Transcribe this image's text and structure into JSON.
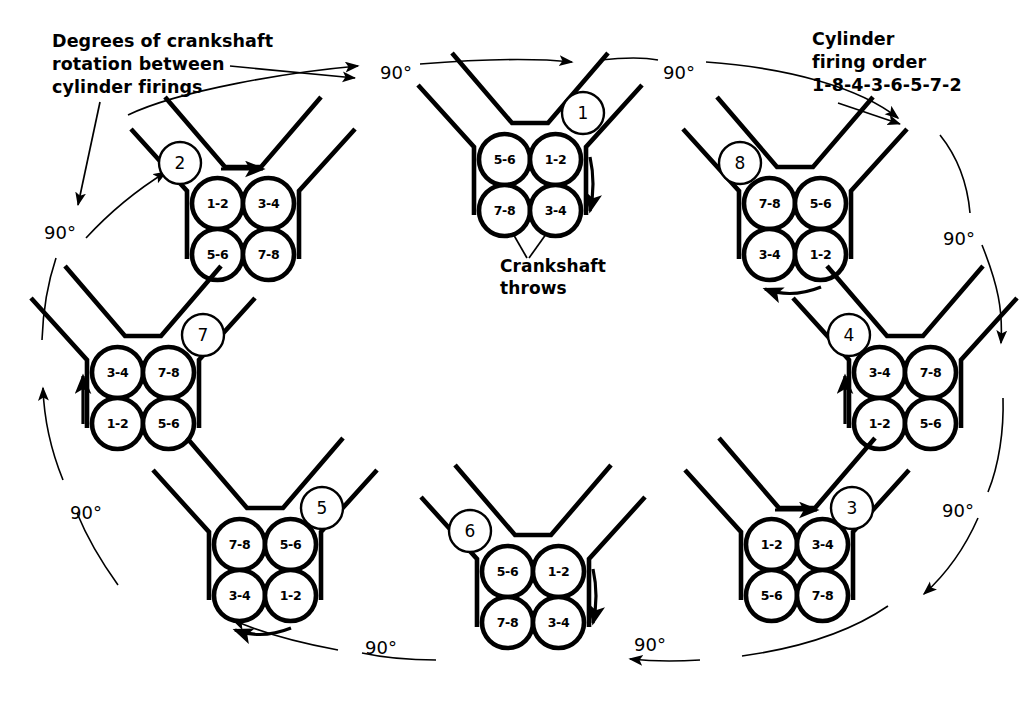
{
  "figure": {
    "title_note_rotation": "Degrees of crankshaft\nrotation between\ncylinder firings",
    "title_note_firing": "Cylinder\nfiring order\n1-8-4-3-6-5-7-2",
    "note_crankshaft_throws": "Crankshaft\nthrows",
    "firing_order": "1-8-4-3-6-5-7-2",
    "ink_color": "#000000",
    "background_color": "#ffffff"
  },
  "rotation_steps": [
    {
      "label": "90°"
    },
    {
      "label": "90°"
    },
    {
      "label": "90°"
    },
    {
      "label": "90°"
    },
    {
      "label": "90°"
    },
    {
      "label": "90°"
    },
    {
      "label": "90°"
    },
    {
      "label": "90°"
    }
  ],
  "engines": [
    {
      "step": "1",
      "cx": 530,
      "cy": 185,
      "badge_x": 583,
      "badge_y": 113,
      "throws": {
        "tl": "5-6",
        "tr": "1-2",
        "bl": "7-8",
        "br": "3-4"
      },
      "arrow": "right-down"
    },
    {
      "step": "2",
      "cx": 243,
      "cy": 229,
      "badge_x": 180,
      "badge_y": 163,
      "throws": {
        "tl": "1-2",
        "tr": "3-4",
        "bl": "5-6",
        "br": "7-8"
      },
      "arrow": "top-right"
    },
    {
      "step": "8",
      "cx": 795,
      "cy": 229,
      "badge_x": 740,
      "badge_y": 163,
      "throws": {
        "tl": "7-8",
        "tr": "5-6",
        "bl": "3-4",
        "br": "1-2"
      },
      "arrow": "bottom-left"
    },
    {
      "step": "7",
      "cx": 143,
      "cy": 398,
      "badge_x": 203,
      "badge_y": 335,
      "throws": {
        "tl": "3-4",
        "tr": "7-8",
        "bl": "1-2",
        "br": "5-6"
      },
      "arrow": "left-up"
    },
    {
      "step": "4",
      "cx": 905,
      "cy": 398,
      "badge_x": 849,
      "badge_y": 335,
      "throws": {
        "tl": "3-4",
        "tr": "7-8",
        "bl": "1-2",
        "br": "5-6"
      },
      "arrow": "left-up"
    },
    {
      "step": "5",
      "cx": 265,
      "cy": 570,
      "badge_x": 322,
      "badge_y": 508,
      "throws": {
        "tl": "7-8",
        "tr": "5-6",
        "bl": "3-4",
        "br": "1-2"
      },
      "arrow": "bottom-left"
    },
    {
      "step": "3",
      "cx": 797,
      "cy": 570,
      "badge_x": 852,
      "badge_y": 508,
      "throws": {
        "tl": "1-2",
        "tr": "3-4",
        "bl": "5-6",
        "br": "7-8"
      },
      "arrow": "top-right"
    },
    {
      "step": "6",
      "cx": 533,
      "cy": 597,
      "badge_x": 470,
      "badge_y": 531,
      "throws": {
        "tl": "5-6",
        "tr": "1-2",
        "bl": "7-8",
        "br": "3-4"
      },
      "arrow": "right-down"
    }
  ],
  "degree_labels": [
    {
      "id": "deg-top-left",
      "text": "90°",
      "x": 380,
      "y": 62
    },
    {
      "id": "deg-top-right",
      "text": "90°",
      "x": 663,
      "y": 62
    },
    {
      "id": "deg-left-upper",
      "text": "90°",
      "x": 44,
      "y": 222
    },
    {
      "id": "deg-right-upper",
      "text": "90°",
      "x": 943,
      "y": 228
    },
    {
      "id": "deg-left-lower",
      "text": "90°",
      "x": 70,
      "y": 502
    },
    {
      "id": "deg-right-lower",
      "text": "90°",
      "x": 942,
      "y": 500
    },
    {
      "id": "deg-bottom-left",
      "text": "90°",
      "x": 365,
      "y": 637
    },
    {
      "id": "deg-bottom-right",
      "text": "90°",
      "x": 634,
      "y": 634
    }
  ]
}
